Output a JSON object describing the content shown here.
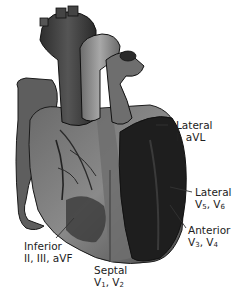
{
  "diagram": {
    "labels": [
      {
        "id": "lateral-i-avl",
        "title": "Lateral",
        "leads": "I, aVL"
      },
      {
        "id": "lateral-v5-v6",
        "title": "Lateral",
        "leads_parts": [
          "V",
          "5",
          ", V",
          "6"
        ]
      },
      {
        "id": "anterior-v3-v4",
        "title": "Anterior",
        "leads_parts": [
          "V",
          "3",
          ", V",
          "4"
        ]
      },
      {
        "id": "inferior",
        "title": "Inferior",
        "leads": "II, III, aVF"
      },
      {
        "id": "septal",
        "title": "Septal",
        "leads_parts": [
          "V",
          "1",
          ", V",
          "2"
        ]
      }
    ],
    "colors": {
      "background": "#ffffff",
      "heart_dark": "#2a2a2a",
      "heart_mid": "#5a5a5a",
      "heart_light": "#9a9a9a",
      "text": "#222222"
    }
  }
}
